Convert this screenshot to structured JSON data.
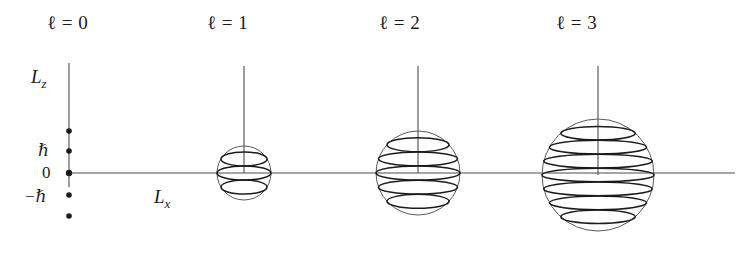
{
  "figure": {
    "background_color": "#ffffff",
    "ink_color": "#1b1b1b",
    "line_color": "#4d4d4d",
    "width": 741,
    "height": 260,
    "axes": {
      "z_axis_label": "L",
      "z_axis_sub": "z",
      "x_axis_label": "L",
      "x_axis_sub": "x",
      "z_axis_x": 69,
      "z_axis_top": 63,
      "z_axis_bottom": 187,
      "x_axis_y": 173,
      "x_axis_left": 69,
      "x_axis_right": 735,
      "z_label_pos": {
        "x": 31,
        "y": 66
      },
      "x_label_pos": {
        "x": 154,
        "y": 186
      }
    },
    "tick_labels": [
      {
        "text": "ℏ",
        "x": 38,
        "y": 140,
        "italic": true
      },
      {
        "text": "0",
        "x": 42,
        "y": 163,
        "italic": false
      },
      {
        "text": "−ℏ",
        "x": 24,
        "y": 186,
        "italic": true
      }
    ],
    "tick_dots": [
      {
        "x": 69,
        "y": 131,
        "r": 2.8,
        "labelled": false
      },
      {
        "x": 69,
        "y": 151,
        "r": 2.8,
        "labelled": true
      },
      {
        "x": 69,
        "y": 173,
        "r": 3.2,
        "labelled": true
      },
      {
        "x": 69,
        "y": 195,
        "r": 2.8,
        "labelled": true
      },
      {
        "x": 69,
        "y": 216,
        "r": 2.8,
        "labelled": false
      }
    ],
    "panels": [
      {
        "id": "panel-l0",
        "title": "ℓ = 0",
        "ell": 0,
        "title_pos": {
          "x": 47,
          "y": 12
        },
        "sphere": null,
        "m_values": [
          0
        ],
        "ring_count": 0
      },
      {
        "id": "panel-l1",
        "title": "ℓ = 1",
        "ell": 1,
        "title_pos": {
          "x": 207,
          "y": 12
        },
        "sphere": {
          "cx": 244,
          "cy": 173,
          "r": 27,
          "stem_top": 66
        },
        "m_values": [
          1,
          0,
          -1
        ],
        "ring_count": 3
      },
      {
        "id": "panel-l2",
        "title": "ℓ = 2",
        "ell": 2,
        "title_pos": {
          "x": 379,
          "y": 12
        },
        "sphere": {
          "cx": 418,
          "cy": 173,
          "r": 42,
          "stem_top": 66
        },
        "m_values": [
          2,
          1,
          0,
          -1,
          -2
        ],
        "ring_count": 5
      },
      {
        "id": "panel-l3",
        "title": "ℓ = 3",
        "ell": 3,
        "title_pos": {
          "x": 556,
          "y": 12
        },
        "sphere": {
          "cx": 598,
          "cy": 175,
          "r": 56,
          "stem_top": 66
        },
        "m_values": [
          3,
          2,
          1,
          0,
          -1,
          -2,
          -3
        ],
        "ring_count": 7
      }
    ]
  },
  "chart_data": {
    "type": "diagram",
    "xlabel": "L_x",
    "ylabel": "L_z",
    "ytick_labels": [
      "ℏ",
      "0",
      "−ℏ"
    ],
    "ytick_values": [
      1,
      0,
      -1
    ],
    "series": [
      {
        "name": "ℓ = 0",
        "ell": 0,
        "L_magnitude_hbar": 0.0,
        "m_values": [
          0
        ],
        "state_count": 1
      },
      {
        "name": "ℓ = 1",
        "ell": 1,
        "L_magnitude_hbar": 1.414,
        "m_values": [
          1,
          0,
          -1
        ],
        "state_count": 3
      },
      {
        "name": "ℓ = 2",
        "ell": 2,
        "L_magnitude_hbar": 2.449,
        "m_values": [
          2,
          1,
          0,
          -1,
          -2
        ],
        "state_count": 5
      },
      {
        "name": "ℓ = 3",
        "ell": 3,
        "L_magnitude_hbar": 3.464,
        "m_values": [
          3,
          2,
          1,
          0,
          -1,
          -2,
          -3
        ],
        "state_count": 7
      }
    ],
    "grid": false,
    "legend": "none"
  }
}
